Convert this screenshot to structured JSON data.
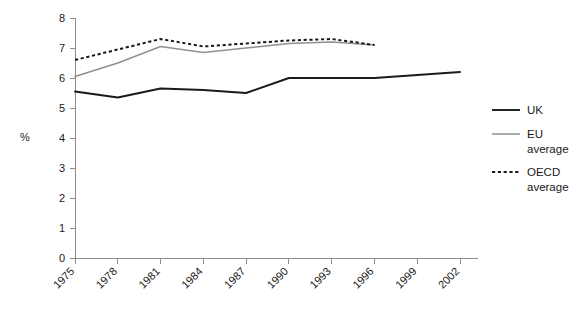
{
  "chart_data": {
    "type": "line",
    "title": "",
    "xlabel": "",
    "ylabel": "%",
    "categories": [
      "1975",
      "1978",
      "1981",
      "1984",
      "1987",
      "1990",
      "1993",
      "1996",
      "1999",
      "2002"
    ],
    "x": [
      1975,
      1978,
      1981,
      1984,
      1987,
      1990,
      1993,
      1996,
      1999,
      2002
    ],
    "ylim": [
      0,
      8
    ],
    "yticks": [
      0,
      1,
      2,
      3,
      4,
      5,
      6,
      7,
      8
    ],
    "ytick_labels": [
      "0",
      "1",
      "2",
      "3",
      "4",
      "5",
      "6",
      "7",
      "8"
    ],
    "xlim": [
      1975,
      2002
    ],
    "grid": false,
    "legend_position": "right",
    "series": [
      {
        "name": "UK",
        "style": "solid",
        "color": "#1a1a1a",
        "x": [
          1975,
          1978,
          1981,
          1984,
          1987,
          1990,
          1993,
          1996,
          1999,
          2002
        ],
        "values": [
          5.55,
          5.35,
          5.65,
          5.6,
          5.5,
          6.0,
          6.0,
          6.0,
          6.1,
          6.2
        ]
      },
      {
        "name": "EU average",
        "style": "solid",
        "color": "#909090",
        "x": [
          1975,
          1978,
          1981,
          1984,
          1987,
          1990,
          1993,
          1996
        ],
        "values": [
          6.05,
          6.5,
          7.05,
          6.85,
          7.0,
          7.15,
          7.2,
          7.1
        ]
      },
      {
        "name": "OECD average",
        "style": "dotted",
        "color": "#1a1a1a",
        "x": [
          1975,
          1978,
          1981,
          1984,
          1987,
          1990,
          1993,
          1996
        ],
        "values": [
          6.6,
          6.95,
          7.3,
          7.05,
          7.15,
          7.25,
          7.3,
          7.1
        ]
      }
    ]
  },
  "legend": {
    "items": [
      {
        "label": "UK",
        "label_line2": ""
      },
      {
        "label": "EU",
        "label_line2": "average"
      },
      {
        "label": "OECD",
        "label_line2": "average"
      }
    ]
  },
  "axis": {
    "y_label": "%"
  }
}
